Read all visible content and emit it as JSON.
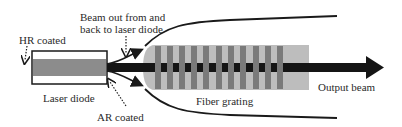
{
  "labels": {
    "hr_coated": "HR coated",
    "beam_out_line1": "Beam out from and",
    "beam_out_line2": "back to laser diode",
    "laser_diode": "Laser diode",
    "ar_coated": "AR coated",
    "fiber_grating": "Fiber grating",
    "output_beam": "Output beam"
  },
  "colors": {
    "grating_background": "#bdbdbd",
    "grating_bar": "#7a7a7a",
    "diode_core": "#8c8c8c",
    "beam": "#151515",
    "outline": "#1a1a1a"
  },
  "grating": {
    "bar_count": 11
  }
}
